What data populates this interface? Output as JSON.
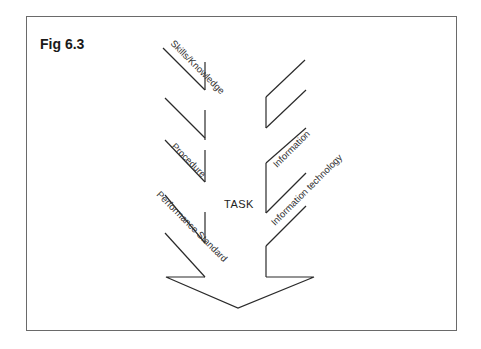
{
  "figure": {
    "title": "Fig 6.3",
    "center_label": "TASK",
    "left_labels": [
      "Skills/Knowledge",
      "Procedure",
      "Performance Standard"
    ],
    "right_labels": [
      "Information",
      "Information technology"
    ],
    "colors": {
      "line": "#2a2a2a",
      "frame": "#6a6a6a",
      "background": "#ffffff"
    }
  }
}
